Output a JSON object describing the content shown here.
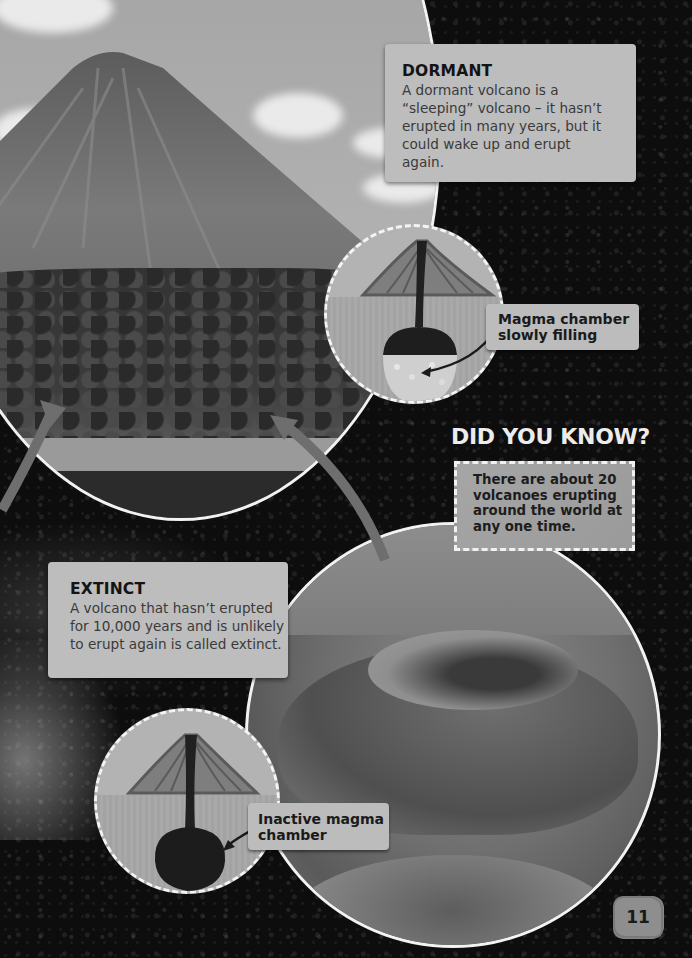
{
  "dormant": {
    "heading": "DORMANT",
    "body": "A dormant volcano is a “sleeping” volcano – it hasn’t erupted in many years, but it could wake up and erupt again.",
    "diagram_label": "Magma chamber slowly filling"
  },
  "did_you_know": {
    "title": "DID YOU KNOW?",
    "body": "There are about 20 volcanoes erupting around the world at any one time."
  },
  "extinct": {
    "heading": "EXTINCT",
    "body": "A volcano that hasn’t erupted for 10,000 years and is unlikely to erupt again is called extinct.",
    "diagram_label": "Inactive magma chamber"
  },
  "images": {
    "top_photo": "cone-shaped-volcano-above-forest-and-lake",
    "bottom_photo": "extinct-cinder-cone-crater"
  },
  "page": {
    "number": "11"
  },
  "colors": {
    "background": "#0d0d0d",
    "panel": "#bdbdbd",
    "heading_text": "#141414",
    "body_text": "#3a3a3a",
    "dyk_title": "#ececec",
    "arrow": "#6e6e6e"
  }
}
